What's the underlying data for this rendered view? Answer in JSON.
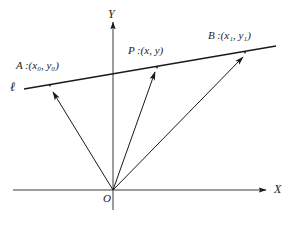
{
  "figure": {
    "background_color": "#ffffff",
    "stroke_color": "#1a1a1a",
    "axes": {
      "x_label": "X",
      "y_label": "Y",
      "origin_label": "O",
      "x_axis": {
        "x1": 13,
        "y1": 190,
        "x2": 266,
        "y2": 190
      },
      "y_axis": {
        "x1": 113,
        "y1": 210,
        "x2": 113,
        "y2": 22
      }
    },
    "line": {
      "name_label": "ℓ",
      "x1": 24,
      "y1": 89,
      "x2": 276,
      "y2": 46
    },
    "points": [
      {
        "id": "A",
        "label_name": "A",
        "label_coords": "(x₀, y₀)",
        "label_text": "A :(x0, y0)",
        "x": 50,
        "y": 85,
        "label_x": 16,
        "label_y": 62
      },
      {
        "id": "P",
        "label_name": "P",
        "label_coords": "(x, y)",
        "label_text": "P :(x, y)",
        "x": 157,
        "y": 67,
        "label_x": 128,
        "label_y": 47
      },
      {
        "id": "B",
        "label_name": "B",
        "label_coords": "(x₁, y₁)",
        "label_text": "B :(x1, y1)",
        "x": 245,
        "y": 52,
        "label_x": 208,
        "label_y": 31
      }
    ],
    "vectors": [
      {
        "id": "OA",
        "from": "O",
        "to": "A",
        "x1": 113,
        "y1": 190,
        "x2": 53,
        "y2": 92
      },
      {
        "id": "OP",
        "from": "O",
        "to": "P",
        "x1": 113,
        "y1": 190,
        "x2": 155,
        "y2": 72
      },
      {
        "id": "OB",
        "from": "O",
        "to": "B",
        "x1": 113,
        "y1": 190,
        "x2": 243,
        "y2": 57
      }
    ]
  }
}
